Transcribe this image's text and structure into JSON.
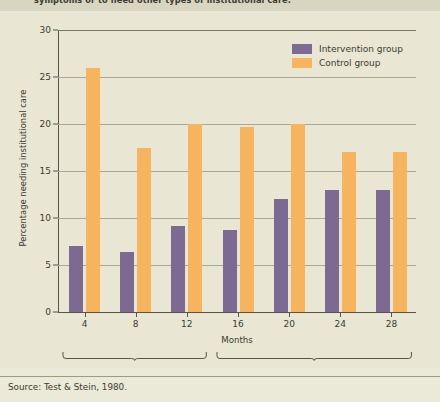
{
  "top_text": "symptoms or to need other types of institutional care.",
  "source": "Source: Test & Stein, 1980.",
  "colors": {
    "intervention": "#7c6a92",
    "control": "#f7b45f",
    "background": "#e9e7d4",
    "grid": "#a9a897",
    "axis": "#55554a",
    "text": "#3b3b31"
  },
  "chart_data": {
    "type": "bar",
    "title": "",
    "xlabel": "Months",
    "ylabel": "Percentage needing institutional care",
    "categories": [
      "4",
      "8",
      "12",
      "16",
      "20",
      "24",
      "28"
    ],
    "ylim": [
      0,
      30
    ],
    "yticks": [
      0,
      5,
      10,
      15,
      20,
      25,
      30
    ],
    "grid": true,
    "legend_position": "top-right",
    "series": [
      {
        "name": "Intervention group",
        "color": "#7c6a92",
        "values": [
          7,
          6.4,
          9.2,
          8.7,
          12,
          13,
          13
        ]
      },
      {
        "name": "Control group",
        "color": "#f7b45f",
        "values": [
          26,
          17.5,
          20,
          19.7,
          20,
          17,
          17
        ]
      }
    ],
    "phases": [
      {
        "label": "During treatment",
        "categories": [
          "4",
          "8",
          "12"
        ]
      },
      {
        "label": "After treatment",
        "categories": [
          "16",
          "20",
          "24",
          "28"
        ]
      }
    ]
  }
}
